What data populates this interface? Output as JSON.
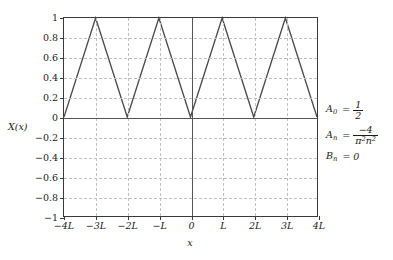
{
  "figure": {
    "axis_title_x": "x",
    "axis_title_y": "X(x)"
  },
  "annotations": [
    {
      "name": "a0",
      "lhs_base": "A",
      "lhs_sub": "0",
      "eq": "=",
      "kind": "fraction",
      "num": "1",
      "den": "2"
    },
    {
      "name": "an",
      "lhs_base": "A",
      "lhs_sub": "n",
      "eq": "=",
      "kind": "fraction",
      "num": "−4",
      "den_pi": "π",
      "den_pi_exp": "2",
      "den_n": "n",
      "den_n_exp": "2"
    },
    {
      "name": "bn",
      "lhs_base": "B",
      "lhs_sub": "n",
      "eq": "=",
      "kind": "plain",
      "value": "0"
    }
  ],
  "chart_data": {
    "type": "line",
    "title": "",
    "xlabel": "x",
    "ylabel": "X(x)",
    "xlim": [
      -4,
      4
    ],
    "ylim": [
      -1,
      1
    ],
    "grid": true,
    "legend": false,
    "x_tick_values": [
      -4,
      -3,
      -2,
      -1,
      0,
      1,
      2,
      3,
      4
    ],
    "x_tick_labels": [
      "−4L",
      "−3L",
      "−2L",
      "−L",
      "0",
      "L",
      "2L",
      "3L",
      "4L"
    ],
    "y_tick_values": [
      1,
      0.8,
      0.6,
      0.4,
      0.2,
      0,
      -0.2,
      -0.4,
      -0.6,
      -0.8,
      -1
    ],
    "y_tick_labels": [
      "1",
      "0.8",
      "0.6",
      "0.4",
      "0.2",
      "0",
      "−0.2",
      "−0.4",
      "−0.6",
      "−0.8",
      "−1"
    ],
    "series": [
      {
        "name": "triangle-wave",
        "color": "#4a4a4a",
        "x": [
          -4,
          -3,
          -2,
          -1,
          0,
          1,
          2,
          3,
          4
        ],
        "y": [
          0,
          1,
          0,
          1,
          0,
          1,
          0,
          1,
          0
        ]
      }
    ]
  }
}
